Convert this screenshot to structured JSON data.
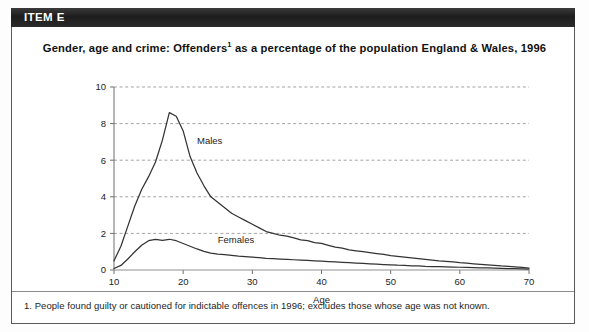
{
  "item": {
    "header_label": "ITEM E"
  },
  "chart_title": {
    "before_sup": "Gender, age and crime: Offenders",
    "sup": "1",
    "after_sup": " as a percentage of the population England & Wales, 1996"
  },
  "footnote": "1. People found guilty or cautioned for indictable offences in 1996; excludes those whose age was not known.",
  "colors": {
    "header_band": "#1d1d1d",
    "header_text": "#ffffff",
    "frame_border": "#5a5a5a",
    "line": "#333333",
    "gridline": "#9a9a9a",
    "axis": "#6e6e6e",
    "text": "#1d1d1d",
    "page_background": "#ffffff"
  },
  "chart_data": {
    "type": "line",
    "xlabel": "Age",
    "ylabel": "",
    "xlim": [
      10,
      70
    ],
    "ylim": [
      0,
      10
    ],
    "xticks": [
      10,
      20,
      30,
      40,
      50,
      60,
      70
    ],
    "yticks": [
      0,
      2,
      4,
      6,
      8,
      10
    ],
    "grid": "horizontal-dashed",
    "legend": "inline-labels",
    "x": [
      10,
      11,
      12,
      13,
      14,
      15,
      16,
      17,
      18,
      19,
      20,
      21,
      22,
      23,
      24,
      25,
      26,
      27,
      28,
      29,
      30,
      31,
      32,
      33,
      34,
      35,
      36,
      37,
      38,
      39,
      40,
      41,
      42,
      43,
      44,
      45,
      46,
      47,
      48,
      49,
      50,
      51,
      52,
      53,
      54,
      55,
      56,
      57,
      58,
      59,
      60,
      61,
      62,
      63,
      64,
      65,
      66,
      67,
      68,
      69,
      70
    ],
    "series": [
      {
        "name": "Males",
        "label_x": 22,
        "label_y": 6.9,
        "values": [
          0.5,
          1.3,
          2.4,
          3.5,
          4.4,
          5.1,
          5.9,
          7.1,
          8.6,
          8.4,
          7.6,
          6.2,
          5.3,
          4.6,
          4.0,
          3.7,
          3.4,
          3.1,
          2.9,
          2.7,
          2.5,
          2.3,
          2.1,
          2.0,
          1.9,
          1.85,
          1.75,
          1.65,
          1.6,
          1.5,
          1.45,
          1.35,
          1.25,
          1.2,
          1.1,
          1.05,
          1.0,
          0.95,
          0.9,
          0.85,
          0.78,
          0.74,
          0.7,
          0.66,
          0.62,
          0.58,
          0.54,
          0.5,
          0.47,
          0.44,
          0.4,
          0.37,
          0.34,
          0.31,
          0.28,
          0.25,
          0.22,
          0.2,
          0.17,
          0.14,
          0.1
        ]
      },
      {
        "name": "Females",
        "label_x": 25,
        "label_y": 1.45,
        "values": [
          0.08,
          0.25,
          0.6,
          1.0,
          1.35,
          1.6,
          1.67,
          1.62,
          1.68,
          1.6,
          1.45,
          1.3,
          1.15,
          1.02,
          0.92,
          0.87,
          0.84,
          0.8,
          0.76,
          0.73,
          0.7,
          0.67,
          0.64,
          0.62,
          0.6,
          0.58,
          0.56,
          0.54,
          0.52,
          0.5,
          0.48,
          0.46,
          0.44,
          0.42,
          0.4,
          0.38,
          0.36,
          0.34,
          0.32,
          0.3,
          0.28,
          0.26,
          0.25,
          0.23,
          0.22,
          0.2,
          0.19,
          0.18,
          0.17,
          0.16,
          0.15,
          0.14,
          0.13,
          0.12,
          0.11,
          0.1,
          0.09,
          0.08,
          0.07,
          0.06,
          0.05
        ]
      }
    ],
    "peaks": {
      "males": {
        "age": 18,
        "value": 8.6
      },
      "females": {
        "age": 16,
        "value": 1.7
      }
    }
  }
}
